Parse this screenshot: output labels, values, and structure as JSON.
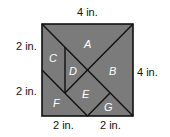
{
  "diagram": {
    "type": "tangram-square",
    "colors": {
      "fill": "#7b7b7b",
      "stroke": "#111111",
      "label": "#ffffff"
    },
    "pieces": [
      {
        "id": "A",
        "label": "A"
      },
      {
        "id": "B",
        "label": "B"
      },
      {
        "id": "C",
        "label": "C"
      },
      {
        "id": "D",
        "label": "D"
      },
      {
        "id": "E",
        "label": "E"
      },
      {
        "id": "F",
        "label": "F"
      },
      {
        "id": "G",
        "label": "G"
      }
    ],
    "dimensions": {
      "top": "4 in.",
      "right": "4 in.",
      "left_upper": "2 in.",
      "left_lower": "2 in.",
      "bottom_left": "2 in.",
      "bottom_right": "2 in."
    }
  }
}
